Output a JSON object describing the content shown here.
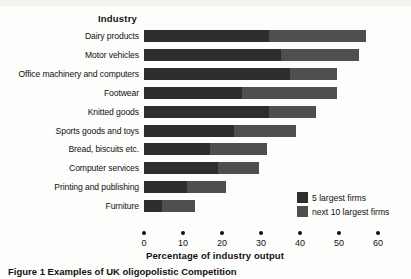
{
  "chart_data": {
    "type": "bar",
    "orientation": "horizontal",
    "stacked": true,
    "title": "",
    "xlabel": "Percentage of industry output",
    "ylabel": "Industry",
    "xlim": [
      0,
      60
    ],
    "xticks": [
      0,
      10,
      20,
      30,
      40,
      50,
      60
    ],
    "xtick_labels": [
      "0",
      "10",
      "20",
      "30",
      "40",
      "50",
      "60"
    ],
    "grid": false,
    "legend_position": "inside-bottom-right",
    "categories": [
      "Dairy products",
      "Motor vehicles",
      "Office machinery and computers",
      "Footwear",
      "Knitted goods",
      "Sports goods and toys",
      "Bread, biscuits etc.",
      "Computer services",
      "Printing and publishing",
      "Furniture"
    ],
    "series": [
      {
        "name": "5 largest firms",
        "color": "#2e2e2e",
        "values": [
          32,
          35,
          37.5,
          25,
          32,
          23,
          17,
          19,
          11,
          4.5
        ]
      },
      {
        "name": "next 10 largest firms",
        "color": "#4f4f4f",
        "values": [
          25,
          20,
          12,
          24.5,
          12,
          16,
          14.5,
          10.5,
          10,
          8.5
        ]
      }
    ],
    "totals": [
      57,
      55,
      49.5,
      49.5,
      44,
      39,
      31.5,
      29.5,
      21,
      13
    ]
  },
  "caption": "Figure 1  Examples of UK oligopolistic Competition"
}
